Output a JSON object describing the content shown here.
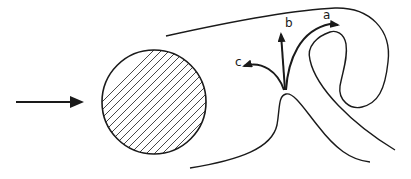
{
  "diagram": {
    "colors": {
      "stroke": "#1a1a1a",
      "background": "#ffffff",
      "hatch": "#333333"
    },
    "incoming_flow_arrow": {
      "from": [
        16,
        102
      ],
      "to": [
        84,
        102
      ]
    },
    "cylinder": {
      "cx": 154,
      "cy": 102,
      "r": 52,
      "fill": "hatched"
    },
    "arrow_labels": {
      "a": "a",
      "b": "b",
      "c": "c"
    }
  }
}
